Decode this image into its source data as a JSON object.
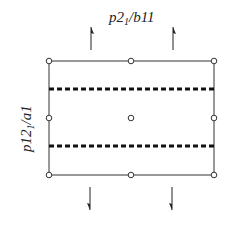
{
  "diagram": {
    "title_top": {
      "prefix": "p2",
      "sub": "1",
      "suffix": "/b11"
    },
    "title_side": {
      "prefix": "p12",
      "sub": "1",
      "suffix": "/a1"
    },
    "cell": {
      "left": 49,
      "right": 214,
      "top": 61,
      "bottom": 175,
      "mid_x": 131,
      "mid_y": 118
    },
    "glide_planes_y": [
      89,
      146
    ],
    "inversion_centers": [
      {
        "x": 49,
        "y": 61
      },
      {
        "x": 131,
        "y": 61
      },
      {
        "x": 214,
        "y": 61
      },
      {
        "x": 49,
        "y": 118
      },
      {
        "x": 131,
        "y": 118
      },
      {
        "x": 214,
        "y": 118
      },
      {
        "x": 49,
        "y": 175
      },
      {
        "x": 131,
        "y": 175
      },
      {
        "x": 214,
        "y": 175
      }
    ],
    "screw_axes_up_x": [
      91,
      173
    ],
    "screw_axes_down_x": [
      90,
      172
    ],
    "colors": {
      "line": "#333333",
      "dash": "#111111"
    }
  }
}
